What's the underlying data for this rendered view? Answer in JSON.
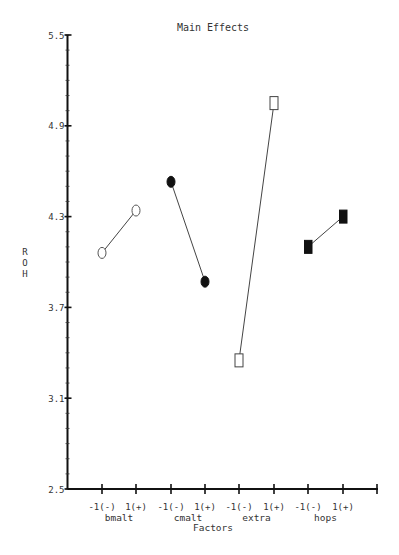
{
  "chart_data": {
    "type": "line",
    "title": "Main Effects",
    "xlabel": "Factors",
    "ylabel": "R O H",
    "ylim": [
      2.5,
      5.5
    ],
    "yticks": [
      "5.5",
      "4.9",
      "4.3",
      "3.7",
      "3.1",
      "2.5"
    ],
    "ytick_values": [
      5.5,
      4.9,
      4.3,
      3.7,
      3.1,
      2.5
    ],
    "grid": false,
    "legend": "none",
    "level_labels": [
      "-1(-)",
      "1(+)"
    ],
    "factors": [
      {
        "name": "bmalt",
        "marker": "open-circle",
        "values": [
          4.06,
          4.34
        ]
      },
      {
        "name": "cmalt",
        "marker": "filled-circle",
        "values": [
          4.53,
          3.87
        ]
      },
      {
        "name": "extra",
        "marker": "open-square",
        "values": [
          3.35,
          5.05
        ]
      },
      {
        "name": "hops",
        "marker": "filled-square",
        "values": [
          4.1,
          4.3
        ]
      }
    ]
  }
}
